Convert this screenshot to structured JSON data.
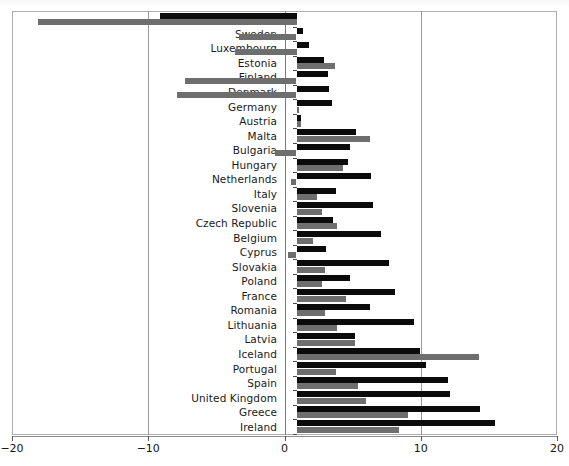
{
  "chart_data": {
    "type": "bar",
    "orientation": "horizontal",
    "title": "",
    "subtitle": "",
    "xlabel": "",
    "ylabel": "",
    "xlim": [
      -20,
      20
    ],
    "xticks": [
      -20,
      -10,
      0,
      10,
      20
    ],
    "xticklabels": [
      "−20",
      "−10",
      "0",
      "10",
      "20"
    ],
    "grid": true,
    "gridlines_x": [
      -10,
      10
    ],
    "zero_line": 0,
    "legend": null,
    "legend_position": "none",
    "categories": [
      "Norway",
      "Sweden",
      "Luxembourg",
      "Estonia",
      "Finland",
      "Denmark",
      "Germany",
      "Austria",
      "Malta",
      "Bulgaria",
      "Hungary",
      "Netherlands",
      "Italy",
      "Slovenia",
      "Czech Republic",
      "Belgium",
      "Cyprus",
      "Slovakia",
      "Poland",
      "France",
      "Romania",
      "Lithuania",
      "Latvia",
      "Iceland",
      "Portugal",
      "Spain",
      "United Kingdom",
      "Greece",
      "Ireland"
    ],
    "series": [
      {
        "name": "series-a",
        "color": "#0b0b0b",
        "values": [
          -10.0,
          0.5,
          0.9,
          2.0,
          2.3,
          2.4,
          2.6,
          0.3,
          4.4,
          3.9,
          3.8,
          5.5,
          2.9,
          5.6,
          2.7,
          6.2,
          2.2,
          6.8,
          3.9,
          7.2,
          5.4,
          8.6,
          4.3,
          9.1,
          9.5,
          11.1,
          11.3,
          13.5,
          14.6
        ]
      },
      {
        "name": "series-b",
        "color": "#6e6e6e",
        "values": [
          -19.0,
          -4.2,
          -4.5,
          2.8,
          -8.2,
          -8.8,
          0.2,
          0.3,
          5.4,
          -1.6,
          3.4,
          -0.4,
          1.5,
          1.9,
          3.0,
          1.2,
          -0.6,
          2.1,
          1.9,
          3.6,
          2.1,
          3.0,
          4.3,
          13.4,
          2.9,
          4.5,
          5.1,
          8.2,
          7.5
        ]
      }
    ]
  }
}
